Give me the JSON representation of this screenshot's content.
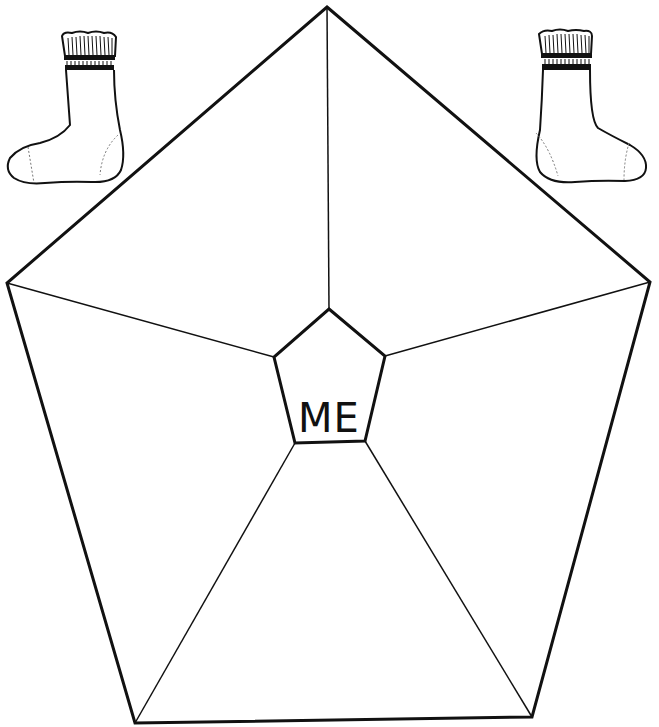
{
  "worksheet": {
    "type": "pentagon-self-reflection",
    "center_label": "ME",
    "outer_sections": 5,
    "line_color": "#111111",
    "background": "#ffffff"
  },
  "decorations": [
    {
      "name": "sock-left",
      "description": "striped-cuff sock, toe pointing left"
    },
    {
      "name": "sock-right",
      "description": "striped-cuff sock, toe pointing right"
    }
  ]
}
